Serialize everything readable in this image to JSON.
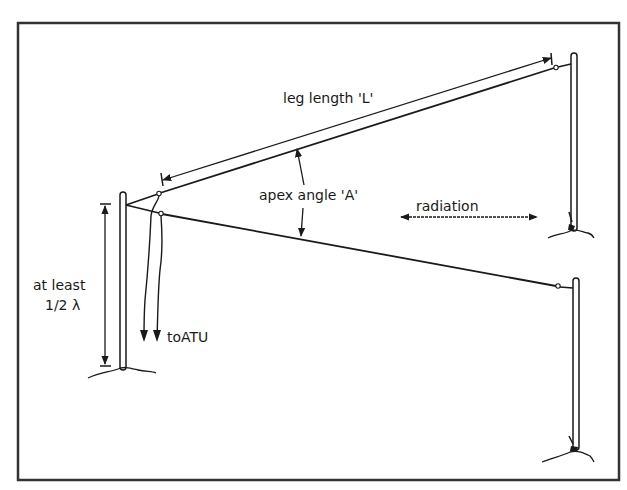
{
  "diagram": {
    "labels": {
      "leg_length": "leg length 'L'",
      "apex_angle": "apex angle 'A'",
      "radiation": "radiation",
      "to_atu": "toATU",
      "height_line1": "at least",
      "height_line2": "1/2 λ"
    },
    "colors": {
      "ink": "#1a1a1a",
      "background": "#ffffff"
    }
  }
}
